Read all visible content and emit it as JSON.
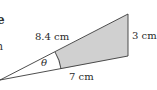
{
  "diagram": {
    "type": "sector-segment geometry figure",
    "labels": {
      "slant_side": "8.4 cm",
      "right_side": "3 cm",
      "base_side": "7 cm",
      "angle": "θ"
    },
    "left_fragments": {
      "top": "e",
      "middle": "n"
    },
    "colors": {
      "line": "#3a3a3a",
      "shade": "#d0d0d0",
      "background": "#ffffff"
    }
  }
}
